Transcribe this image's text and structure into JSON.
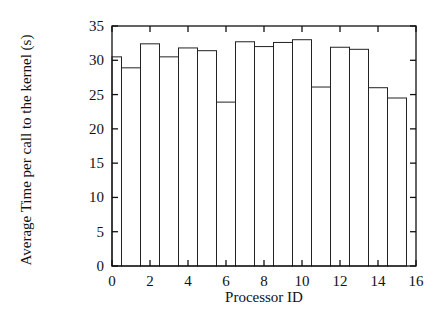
{
  "chart_data": {
    "type": "bar",
    "title": "",
    "xlabel": "Processor ID",
    "ylabel": "Average Time per call to the kernel (s)",
    "categories": [
      0,
      1,
      2,
      3,
      4,
      5,
      6,
      7,
      8,
      9,
      10,
      11,
      12,
      13,
      14,
      15
    ],
    "values": [
      30.5,
      28.9,
      32.4,
      30.5,
      31.8,
      31.4,
      23.9,
      32.7,
      32.0,
      32.6,
      33.0,
      26.1,
      31.9,
      31.6,
      26.0,
      24.5
    ],
    "bar_width": 1,
    "xlim": [
      0,
      16
    ],
    "ylim": [
      0,
      35
    ],
    "xticks": [
      0,
      2,
      4,
      6,
      8,
      10,
      12,
      14,
      16
    ],
    "yticks": [
      0,
      5,
      10,
      15,
      20,
      25,
      30,
      35
    ],
    "grid": false,
    "legend": null,
    "colors": {
      "bar_fill": "#ffffff",
      "bar_edge": "#222222",
      "axis": "#111111"
    }
  }
}
